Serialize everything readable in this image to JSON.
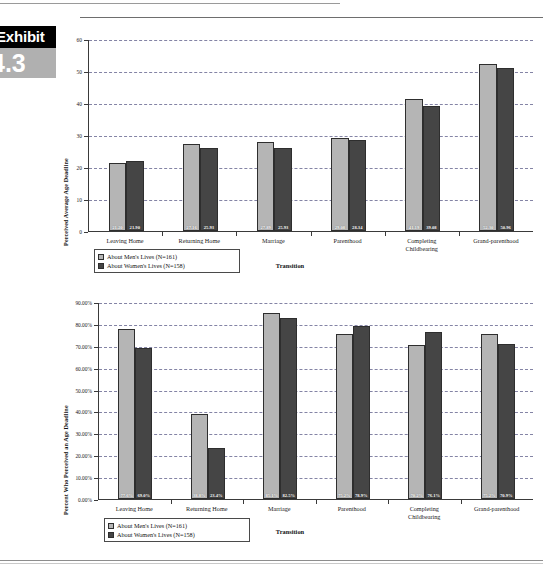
{
  "exhibit": {
    "word": "Exhibit",
    "number": "4.3"
  },
  "legend": {
    "men_label": "About Men's Lives (N=161)",
    "women_label": "About Women's Lives (N=158)",
    "men_color": "#b5b5b5",
    "women_color": "#454545"
  },
  "charts": [
    {
      "id": "perceived-average-age-deadline",
      "xlabel": "Transition",
      "ylabel": "Perceived Average Age Deadline"
    },
    {
      "id": "percent-who-perceived-an-age-deadline",
      "xlabel": "Transition",
      "ylabel": "Percent Who Perceived an Age Deadline"
    }
  ],
  "chart_data": [
    {
      "type": "bar",
      "title": "",
      "xlabel": "Transition",
      "ylabel": "Perceived Average Age Deadline",
      "categories": [
        "Leaving Home",
        "Returning Home",
        "Marriage",
        "Parenthood",
        "Completing\nChildbearing",
        "Grand-parenthood"
      ],
      "ylim": [
        0,
        60
      ],
      "yticks": [
        0,
        10,
        20,
        30,
        40,
        50,
        60
      ],
      "ytick_labels": [
        "0",
        "10",
        "20",
        "30",
        "40",
        "50",
        "60"
      ],
      "grid": true,
      "legend_position": "below-left",
      "series": [
        {
          "name": "About Men's Lives (N=161)",
          "color": "#b5b5b5",
          "values": [
            21.2,
            27.16,
            27.89,
            29.08,
            41.19,
            52.3
          ],
          "labels": [
            "21.20",
            "27.16",
            "27.89",
            "29.08",
            "41.19",
            "52.30"
          ]
        },
        {
          "name": "About Women's Lives (N=158)",
          "color": "#454545",
          "values": [
            21.9,
            25.93,
            25.93,
            28.34,
            39.08,
            50.96
          ],
          "labels": [
            "21.90",
            "25.93",
            "25.93",
            "28.34",
            "39.08",
            "50.96"
          ]
        }
      ]
    },
    {
      "type": "bar",
      "title": "",
      "xlabel": "Transition",
      "ylabel": "Percent Who Perceived an Age Deadline",
      "categories": [
        "Leaving Home",
        "Returning Home",
        "Marriage",
        "Parenthood",
        "Completing\nChildbearing",
        "Grand-parenthood"
      ],
      "ylim": [
        0,
        90
      ],
      "yticks": [
        0,
        10,
        20,
        30,
        40,
        50,
        60,
        70,
        80,
        90
      ],
      "ytick_labels": [
        "0.00%",
        "10.00%",
        "20.00%",
        "30.00%",
        "40.00%",
        "50.00%",
        "60.00%",
        "70.00%",
        "80.00%",
        "90.00%"
      ],
      "grid": true,
      "legend_position": "below-left",
      "series": [
        {
          "name": "About Men's Lives (N=161)",
          "color": "#b5b5b5",
          "values": [
            77.6,
            38.8,
            85.1,
            75.2,
            70.2,
            75.2
          ],
          "labels": [
            "77.6%",
            "38.8%",
            "85.1%",
            "75.2%",
            "70.2%",
            "75.2%"
          ]
        },
        {
          "name": "About Women's Lives (N=158)",
          "color": "#454545",
          "values": [
            69.0,
            23.4,
            82.5,
            78.9,
            76.1,
            70.9
          ],
          "labels": [
            "69.0%",
            "23.4%",
            "82.5%",
            "78.9%",
            "76.1%",
            "70.9%"
          ]
        }
      ]
    }
  ]
}
